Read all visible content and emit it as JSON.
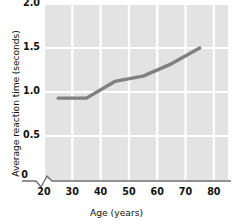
{
  "chart_data": {
    "type": "line",
    "title": "",
    "xlabel": "Age (years)",
    "ylabel": "Average reaction time (seconds)",
    "xlim": [
      20,
      85
    ],
    "ylim": [
      0,
      2.0
    ],
    "x_ticks": [
      20,
      30,
      40,
      50,
      60,
      70,
      80
    ],
    "x_tick_labels": [
      "20",
      "30",
      "40",
      "50",
      "60",
      "70",
      "80"
    ],
    "y_ticks": [
      0,
      0.5,
      1.0,
      1.5,
      2.0
    ],
    "y_tick_labels": [
      "0",
      "0.5",
      "1.0",
      "1.5",
      "2.0"
    ],
    "grid": true,
    "grid_color": "#ffffff",
    "plot_background": "#e3e3e3",
    "axis_break": true,
    "axis_break_label": "0",
    "legend": null,
    "line_color": "#808080",
    "series": [
      {
        "name": "Average reaction time",
        "x": [
          25,
          35,
          45,
          55,
          65,
          75
        ],
        "values": [
          0.93,
          0.93,
          1.12,
          1.18,
          1.32,
          1.5
        ]
      }
    ]
  },
  "axis": {
    "y_title": "Average reaction time (seconds)",
    "x_title": "Age (years)",
    "origin_label": "0"
  }
}
